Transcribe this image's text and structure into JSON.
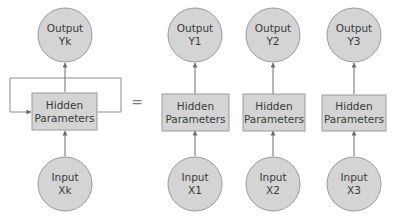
{
  "colors": {
    "node_fill": "#d4d4d4",
    "node_stroke": "#9a9a9a",
    "arrow": "#6f6f6f",
    "text": "#3a3a3a"
  },
  "diagram": {
    "rolled": {
      "output": {
        "line1": "Output",
        "line2": "Yk"
      },
      "hidden": {
        "line1": "Hidden",
        "line2": "Parameters"
      },
      "input": {
        "line1": "Input",
        "line2": "Xk"
      },
      "feedback_loop": true
    },
    "equals": "=",
    "unrolled": [
      {
        "output": {
          "line1": "Output",
          "line2": "Y1"
        },
        "hidden": {
          "line1": "Hidden",
          "line2": "Parameters"
        },
        "input": {
          "line1": "Input",
          "line2": "X1"
        }
      },
      {
        "output": {
          "line1": "Output",
          "line2": "Y2"
        },
        "hidden": {
          "line1": "Hidden",
          "line2": "Parameters"
        },
        "input": {
          "line1": "Input",
          "line2": "X2"
        }
      },
      {
        "output": {
          "line1": "Output",
          "line2": "Y3"
        },
        "hidden": {
          "line1": "Hidden",
          "line2": "Parameters"
        },
        "input": {
          "line1": "Input",
          "line2": "X3"
        }
      }
    ]
  }
}
